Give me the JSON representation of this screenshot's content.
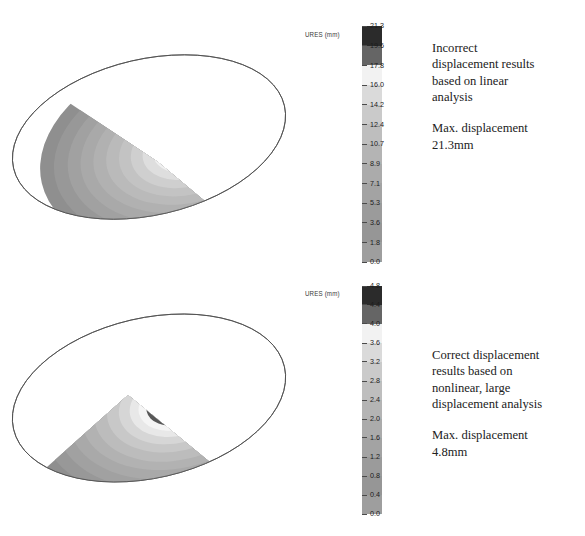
{
  "figure": {
    "kind": "fea-displacement-contour-comparison",
    "background": "#ffffff"
  },
  "chart_data": {
    "type": "heatmap",
    "title": "",
    "subtitle": "",
    "panels": [
      {
        "id": "linear",
        "plot_label": "URES (mm)",
        "quantity": "URES",
        "units": "mm",
        "colormap": "grayscale",
        "max_value": 21.3,
        "min_value": 0.0,
        "legend_position": "right-of-plot",
        "tick_values": [
          "21.3",
          "19.6",
          "17.8",
          "16.0",
          "14.2",
          "12.4",
          "10.7",
          "8.9",
          "7.1",
          "5.3",
          "3.6",
          "1.8",
          "0.0"
        ],
        "band_colors": [
          "#2b2b2b",
          "#656565",
          "#f2f2f2",
          "#dadada",
          "#cacaca",
          "#bebebe",
          "#b4b4b4",
          "#ababab",
          "#a3a3a3",
          "#9b9b9b",
          "#969696",
          "#9e9e9e"
        ],
        "contour_colors": [
          "#8f8f8f",
          "#989898",
          "#a0a0a0",
          "#a8a8a8",
          "#b0b0b0",
          "#b9b9b9",
          "#c2c2c2",
          "#cdcdcd",
          "#dcdcdc",
          "#efefef",
          "#5e5e5e",
          "#262626"
        ],
        "annotation": {
          "description": "Incorrect displacement results based on linear analysis",
          "max_line1": "Max. displacement",
          "max_line2": "21.3mm"
        }
      },
      {
        "id": "nonlinear",
        "plot_label": "URES (mm)",
        "quantity": "URES",
        "units": "mm",
        "colormap": "grayscale",
        "max_value": 4.8,
        "min_value": 0.0,
        "legend_position": "right-of-plot",
        "tick_values": [
          "4.8",
          "4.4",
          "4.0",
          "3.6",
          "3.2",
          "2.8",
          "2.4",
          "2.0",
          "1.6",
          "1.2",
          "0.8",
          "0.4",
          "0.0"
        ],
        "band_colors": [
          "#2b2b2b",
          "#656565",
          "#f2f2f2",
          "#dadada",
          "#cacaca",
          "#bebebe",
          "#b4b4b4",
          "#ababab",
          "#a3a3a3",
          "#9b9b9b",
          "#969696",
          "#9e9e9e"
        ],
        "contour_colors": [
          "#8f8f8f",
          "#989898",
          "#a0a0a0",
          "#a8a8a8",
          "#b0b0b0",
          "#b9b9b9",
          "#c4c4c4",
          "#d2d2d2",
          "#e6e6e6",
          "#f4f4f4",
          "#575757",
          "#242424"
        ],
        "annotation": {
          "description": "Correct displacement results based on nonlinear, large displacement analysis",
          "max_line1": "Max. displacement",
          "max_line2": "4.8mm"
        }
      }
    ],
    "xlabel": "",
    "ylabel": "",
    "grid": false
  },
  "panel_top": {
    "colorbar_title": "URES (mm)",
    "ticks": [
      "21.3",
      "19.6",
      "17.8",
      "16.0",
      "14.2",
      "12.4",
      "10.7",
      "8.9",
      "7.1",
      "5.3",
      "3.6",
      "1.8",
      "0.0"
    ],
    "text_line1": "Incorrect",
    "text_line2": "displacement results",
    "text_line3": "based on linear",
    "text_line4": "analysis",
    "text_max1": "Max. displacement",
    "text_max2": "21.3mm"
  },
  "panel_bottom": {
    "colorbar_title": "URES (mm)",
    "ticks": [
      "4.8",
      "4.4",
      "4.0",
      "3.6",
      "3.2",
      "2.8",
      "2.4",
      "2.0",
      "1.6",
      "1.2",
      "0.8",
      "0.4",
      "0.0"
    ],
    "text_line1": "Correct displacement",
    "text_line2": "results based on",
    "text_line3": "nonlinear, large",
    "text_line4": "displacement analysis",
    "text_max1": "Max. displacement",
    "text_max2": "4.8mm"
  }
}
